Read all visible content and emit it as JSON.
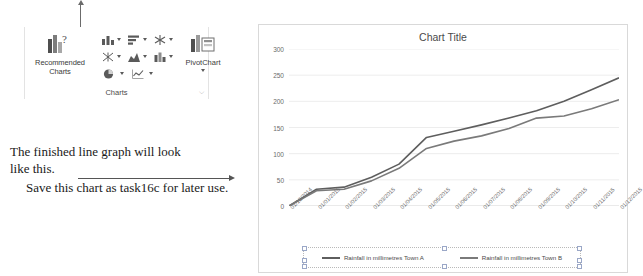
{
  "ribbon": {
    "group_label": "Charts",
    "dialog_launcher_icon": "dialog-box-launcher-icon",
    "recommended_charts": {
      "label_line1": "Recommended",
      "label_line2": "Charts",
      "icon": "recommended-charts-icon"
    },
    "chart_type_buttons": [
      {
        "name": "column-chart-icon",
        "label": "Insert Column or Bar Chart"
      },
      {
        "name": "bar-chart-icon",
        "label": "Insert Hierarchy Chart"
      },
      {
        "name": "radar-chart-icon",
        "label": "Insert Waterfall or Stock Chart"
      },
      {
        "name": "scatter-chart-icon",
        "label": "Insert Scatter or Bubble Chart"
      },
      {
        "name": "area-chart-icon",
        "label": "Insert Line or Area Chart"
      },
      {
        "name": "statistic-chart-icon",
        "label": "Insert Statistic Chart"
      },
      {
        "name": "pie-chart-icon",
        "label": "Insert Pie or Doughnut Chart"
      },
      {
        "name": "combo-chart-icon",
        "label": "Insert Combo Chart"
      }
    ],
    "pivot_chart": {
      "label": "PivotChart",
      "icon": "pivotchart-icon"
    }
  },
  "annotation": {
    "line1": "The finished line graph will look",
    "line2": "like this.",
    "line3": "Save this chart as task16c for later use."
  },
  "chart_data": {
    "type": "line",
    "title": "Chart Title",
    "xlabel": "",
    "ylabel": "",
    "ylim": [
      0,
      300
    ],
    "yticks": [
      0,
      50,
      100,
      150,
      200,
      250,
      300
    ],
    "grid": true,
    "legend_position": "bottom",
    "categories": [
      "01/12/2014",
      "01/01/2015",
      "01/02/2015",
      "01/03/2015",
      "01/04/2015",
      "01/05/2015",
      "01/06/2015",
      "01/07/2015",
      "01/08/2015",
      "01/09/2015",
      "01/10/2015",
      "01/11/2015",
      "01/12/2015"
    ],
    "series": [
      {
        "name": "Rainfall in millimetres Town A",
        "color": "#5e5e5e",
        "values": [
          0,
          32,
          36,
          55,
          80,
          131,
          143,
          155,
          168,
          182,
          200,
          222,
          245
        ]
      },
      {
        "name": "Rainfall in millimetres Town B",
        "color": "#7a7a7a",
        "values": [
          0,
          29,
          32,
          48,
          72,
          110,
          124,
          134,
          148,
          168,
          172,
          186,
          203
        ]
      }
    ]
  }
}
